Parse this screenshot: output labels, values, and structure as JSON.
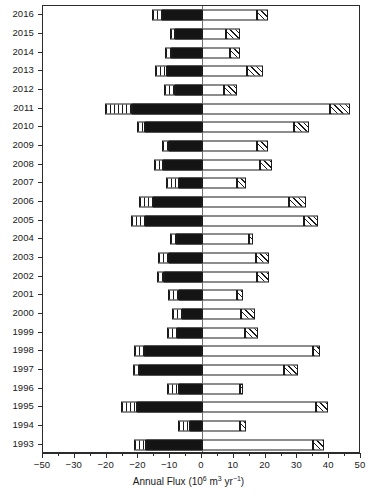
{
  "chart_data": {
    "type": "bar",
    "orientation": "horizontal",
    "stacked": true,
    "diverging": true,
    "title": "",
    "xlabel_text": "Annual Flux (10⁶ m³ yr⁻¹)",
    "xlabel_parts": {
      "lead": "Annual Flux (10",
      "exp1": "6",
      "mid": " m",
      "exp2": "3",
      "unit": " yr",
      "exp3": "−1",
      "close": ")"
    },
    "ylabel": "",
    "xlim": [
      -50,
      50
    ],
    "xticks": [
      -50,
      -30,
      -20,
      -20,
      -10,
      0,
      10,
      20,
      30,
      40,
      50
    ],
    "xtick_labels": [
      "−50",
      "−30",
      "−20",
      "−20",
      "−10",
      "0",
      "10",
      "20",
      "30",
      "40",
      "50"
    ],
    "xtick_positions": [
      -50,
      -40,
      -30,
      -20,
      -10,
      0,
      10,
      20,
      30,
      40,
      50
    ],
    "xtick_minor_step": 5,
    "grid": false,
    "legend": "none",
    "categories": [
      "2016",
      "2015",
      "2014",
      "2013",
      "2012",
      "2011",
      "2010",
      "2009",
      "2008",
      "2007",
      "2006",
      "2005",
      "2004",
      "2003",
      "2002",
      "2001",
      "2000",
      "1999",
      "1998",
      "1997",
      "1996",
      "1995",
      "1994",
      "1993"
    ],
    "series": [
      {
        "name": "negative-outer-striped",
        "pattern": "vertical-stripes",
        "values": [
          -3.2,
          -1.6,
          -2.0,
          -3.6,
          -3.3,
          -8.4,
          -2.3,
          -2.2,
          -2.8,
          -3.9,
          -4.4,
          -4.4,
          -1.9,
          -3.3,
          -2.1,
          -3.5,
          -3.0,
          -3.3,
          -3.1,
          -2.0,
          -4.0,
          -4.9,
          -3.9,
          -3.8
        ]
      },
      {
        "name": "negative-inner-solid",
        "pattern": "solid-black",
        "values": [
          -12.6,
          -8.4,
          -9.7,
          -11.1,
          -8.6,
          -22.1,
          -18.0,
          -10.3,
          -12.4,
          -7.3,
          -15.5,
          -18.0,
          -8.3,
          -10.5,
          -11.9,
          -7.3,
          -6.4,
          -7.8,
          -18.2,
          -19.8,
          -7.1,
          -20.5,
          -3.8,
          -17.7
        ]
      },
      {
        "name": "positive-inner-open",
        "pattern": "open-white",
        "values": [
          17.2,
          7.7,
          8.7,
          14.0,
          6.8,
          40.3,
          29.0,
          17.2,
          18.2,
          11.1,
          27.3,
          32.2,
          14.7,
          17.0,
          17.3,
          10.9,
          12.2,
          13.4,
          35.0,
          25.7,
          11.8,
          35.8,
          11.9,
          34.8
        ]
      },
      {
        "name": "positive-outer-hatched",
        "pattern": "diagonal-hatch",
        "values": [
          3.5,
          4.4,
          3.2,
          5.1,
          4.1,
          6.1,
          4.8,
          3.6,
          3.9,
          2.6,
          5.3,
          4.2,
          1.2,
          4.0,
          3.8,
          2.1,
          4.5,
          4.2,
          2.1,
          4.6,
          1.2,
          3.7,
          2.0,
          3.5
        ]
      }
    ]
  }
}
